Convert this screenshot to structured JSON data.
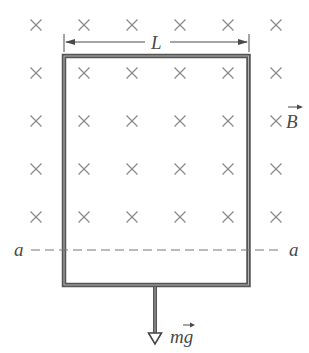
{
  "diagram": {
    "type": "physics",
    "labels": {
      "width": "L",
      "field": "B",
      "weight": "mg",
      "line_left": "a",
      "line_right": "a"
    },
    "field_marker_symbol": "×",
    "field_marker_grid": {
      "columns_x": [
        36,
        84,
        132,
        180,
        228,
        276
      ],
      "rows_y": [
        25,
        73,
        121,
        169,
        217
      ]
    },
    "colors": {
      "loop": "#4a4a4a",
      "markers": "#8a8a8a",
      "text": "#4a4a4a",
      "dashed_line": "#7a7a7a"
    }
  }
}
